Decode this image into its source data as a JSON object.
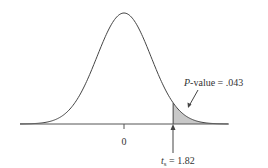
{
  "chart_data": {
    "type": "area",
    "title": "",
    "distribution": "t",
    "center": 0,
    "x_range": [
      -3.85,
      3.85
    ],
    "tick_labels": [
      "0"
    ],
    "test_statistic": {
      "symbol": "t",
      "subscript": "s",
      "value": 1.82,
      "label": "t_s = 1.82"
    },
    "shaded_region": {
      "from": 1.82,
      "to": "inf",
      "tail": "upper",
      "area": 0.043,
      "color": "#c8c8c8"
    },
    "annotation": {
      "text_italic": "P",
      "text_rest": "-value = .043",
      "value": 0.043
    },
    "xlabel": "",
    "ylabel": "",
    "grid": false,
    "legend": null
  },
  "labels": {
    "tick_zero": "0",
    "stat_symbol": "t",
    "stat_subscript": "s",
    "stat_eq": " = 1.82",
    "pvalue_italic": "P",
    "pvalue_rest": "-value = .043"
  },
  "colors": {
    "curve": "#444444",
    "shade": "#c8c8c8",
    "axis": "#555555"
  }
}
